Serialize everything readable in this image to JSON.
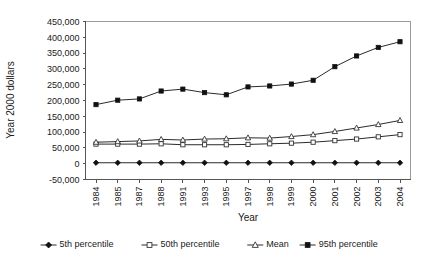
{
  "chart_data": {
    "type": "line",
    "title": "",
    "xlabel": "Year",
    "ylabel": "Year 2000 dollars",
    "categories": [
      "1984",
      "1985",
      "1987",
      "1988",
      "1991",
      "1993",
      "1995",
      "1997",
      "1998",
      "1999",
      "2000",
      "2001",
      "2002",
      "2003",
      "2004"
    ],
    "ylim": [
      -50000,
      450000
    ],
    "ytick_step": 50000,
    "ytick_labels": [
      "450,000",
      "400,000",
      "350,000",
      "300,000",
      "250,000",
      "200,000",
      "150,000",
      "100,000",
      "50,000",
      "0",
      "-50,000"
    ],
    "ytick_values": [
      450000,
      400000,
      350000,
      300000,
      250000,
      200000,
      150000,
      100000,
      50000,
      0,
      -50000
    ],
    "grid": false,
    "legend_position": "bottom",
    "series": [
      {
        "name": "5th percentile",
        "marker": "filled-diamond",
        "values": [
          3000,
          3000,
          3000,
          3000,
          3000,
          3000,
          3000,
          3000,
          3000,
          3000,
          3000,
          3000,
          3000,
          3000,
          3000
        ]
      },
      {
        "name": "50th percentile",
        "marker": "open-square",
        "values": [
          62000,
          62000,
          62000,
          63000,
          60000,
          60000,
          60000,
          61000,
          63000,
          65000,
          68000,
          73000,
          78000,
          85000,
          92000
        ]
      },
      {
        "name": "Mean",
        "marker": "open-triangle",
        "values": [
          68000,
          70000,
          72000,
          77000,
          75000,
          78000,
          79000,
          82000,
          81000,
          86000,
          92000,
          102000,
          113000,
          124000,
          137000
        ]
      },
      {
        "name": "95th percentile",
        "marker": "filled-square",
        "values": [
          187000,
          201000,
          205000,
          230000,
          236000,
          225000,
          218000,
          243000,
          246000,
          252000,
          264000,
          307000,
          341000,
          368000,
          386000
        ]
      }
    ]
  },
  "colors": {
    "series_line": "#2b2b2b",
    "marker_fill": "#111111",
    "marker_open_fill": "#ffffff",
    "axis": "#555555",
    "frame": "#9a9a9a",
    "text": "#1a1a1a",
    "background": "#ffffff"
  }
}
